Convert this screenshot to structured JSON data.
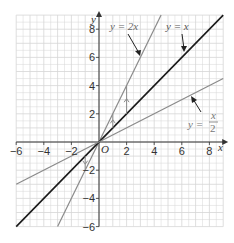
{
  "chart_data": {
    "type": "line",
    "title": "",
    "xlabel": "x",
    "ylabel": "y",
    "origin_label": "O",
    "xlim": [
      -6,
      9
    ],
    "ylim": [
      -6,
      9
    ],
    "grid": true,
    "x_ticks": [
      -6,
      -4,
      -2,
      2,
      4,
      6,
      8
    ],
    "y_ticks": [
      8,
      6,
      4,
      2,
      -2,
      -4,
      -6
    ],
    "series": [
      {
        "name": "y = 2x",
        "label": "y = 2x",
        "slope": 2,
        "color": "#8a8a8a",
        "x": [
          -3,
          4.5
        ],
        "y": [
          -6,
          9
        ]
      },
      {
        "name": "y = x",
        "label": "y = x",
        "slope": 1,
        "color": "#1a1a1a",
        "x": [
          -6,
          9
        ],
        "y": [
          -6,
          9
        ]
      },
      {
        "name": "y = x/2",
        "label_lhs": "y =",
        "label_num": "x",
        "label_den": "2",
        "slope": 0.5,
        "color": "#8a8a8a",
        "x": [
          -6,
          9
        ],
        "y": [
          -3,
          4.5
        ]
      }
    ],
    "annotations": [
      {
        "type": "vertical-arrow",
        "x": 1,
        "from_y": 1,
        "to_y": 2
      },
      {
        "type": "vertical-arrow",
        "x": 2,
        "from_y": 2,
        "to_y": 4
      },
      {
        "type": "vertical-arrow",
        "x": -1,
        "from_y": -1,
        "to_y": -2
      }
    ]
  },
  "colors": {
    "grid": "#d6d6d6",
    "axis": "#333333",
    "dark_line": "#1a1a1a",
    "gray_line": "#8a8a8a"
  }
}
